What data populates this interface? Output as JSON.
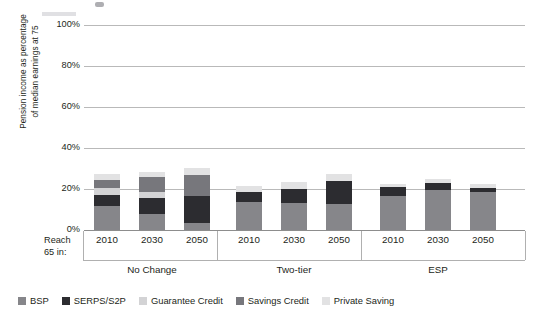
{
  "chart_data": {
    "type": "bar",
    "stacked": true,
    "title": "",
    "xlabel": "",
    "ylabel": "Pension income as percentage of median earnings at 75",
    "ylabel_lines": [
      "Pension income as percentage",
      "of median earnings at 75"
    ],
    "ylim": [
      0,
      100
    ],
    "yticks": [
      0,
      20,
      40,
      60,
      80,
      100
    ],
    "ytick_labels": [
      "0%",
      "20%",
      "40%",
      "60%",
      "80%",
      "100%"
    ],
    "grid": true,
    "legend_position": "bottom",
    "axis_prefix_label": [
      "Reach",
      "65 in:"
    ],
    "group_labels": [
      "No Change",
      "Two-tier",
      "ESP"
    ],
    "categories": [
      "2010",
      "2030",
      "2050",
      "2010",
      "2030",
      "2050",
      "2010",
      "2030",
      "2050"
    ],
    "series": [
      {
        "name": "BSP",
        "color": "#86868a",
        "values": [
          11.5,
          8.0,
          3.5,
          13.5,
          13.0,
          12.5,
          16.5,
          19.5,
          18.5
        ]
      },
      {
        "name": "SERPS/S2P",
        "color": "#2c2c30",
        "values": [
          5.5,
          7.5,
          13.0,
          5.0,
          7.0,
          11.5,
          4.5,
          3.5,
          2.0
        ]
      },
      {
        "name": "Guarantee Credit",
        "color": "#d3d3d5",
        "values": [
          3.5,
          3.0,
          0.0,
          0.0,
          0.0,
          0.0,
          0.0,
          0.0,
          0.0
        ]
      },
      {
        "name": "Savings Credit",
        "color": "#77777c",
        "values": [
          4.0,
          7.5,
          10.5,
          0.0,
          0.0,
          0.0,
          0.0,
          0.0,
          0.0
        ]
      },
      {
        "name": "Private Saving",
        "color": "#e2e2e3",
        "values": [
          3.0,
          2.5,
          3.5,
          3.0,
          3.5,
          3.5,
          1.5,
          2.0,
          2.0
        ]
      }
    ],
    "group_totals": [
      27.5,
      28.5,
      30.5,
      21.5,
      23.5,
      27.5,
      22.5,
      25.0,
      22.5
    ]
  },
  "legend": {
    "items": [
      {
        "label": "BSP"
      },
      {
        "label": "SERPS/S2P"
      },
      {
        "label": "Guarantee Credit"
      },
      {
        "label": "Savings Credit"
      },
      {
        "label": "Private Saving"
      }
    ]
  }
}
